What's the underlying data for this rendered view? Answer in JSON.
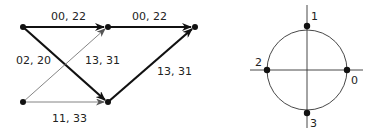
{
  "left_diagram": {
    "nodes": [
      {
        "id": "a",
        "x": 23,
        "y": 27
      },
      {
        "id": "b",
        "x": 108,
        "y": 27
      },
      {
        "id": "c",
        "x": 195,
        "y": 27
      },
      {
        "id": "d",
        "x": 23,
        "y": 102
      },
      {
        "id": "e",
        "x": 108,
        "y": 102
      }
    ],
    "edges": [
      {
        "from": "a",
        "to": "b",
        "label": "00, 22",
        "weight": "thick"
      },
      {
        "from": "b",
        "to": "c",
        "label": "00, 22",
        "weight": "thick"
      },
      {
        "from": "a",
        "to": "e",
        "label": "02, 20",
        "weight": "thick"
      },
      {
        "from": "d",
        "to": "b",
        "label": "13, 31",
        "weight": "thin"
      },
      {
        "from": "e",
        "to": "c",
        "label": "13, 31",
        "weight": "thick"
      },
      {
        "from": "d",
        "to": "e",
        "label": "11, 33",
        "weight": "thin"
      }
    ],
    "labels": {
      "ab": "00, 22",
      "bc": "00, 22",
      "ae": "02, 20",
      "db": "13, 31",
      "ec": "13, 31",
      "de": "11, 33"
    }
  },
  "right_diagram": {
    "type": "constellation",
    "points": {
      "p0": "0",
      "p1": "1",
      "p2": "2",
      "p3": "3"
    }
  },
  "colors": {
    "stroke": "#111111",
    "thin_stroke": "#777777",
    "text": "#222222"
  }
}
